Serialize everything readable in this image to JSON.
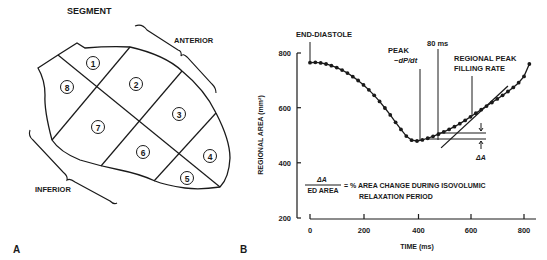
{
  "panel_a": {
    "label": "A",
    "title": "SEGMENT",
    "bracket_labels": {
      "anterior": "ANTERIOR",
      "inferior": "INFERIOR"
    },
    "segments": [
      {
        "number": "1",
        "cx": 93,
        "cy": 63
      },
      {
        "number": "2",
        "cx": 136,
        "cy": 84
      },
      {
        "number": "3",
        "cx": 179,
        "cy": 114
      },
      {
        "number": "4",
        "cx": 210,
        "cy": 156
      },
      {
        "number": "5",
        "cx": 187,
        "cy": 178
      },
      {
        "number": "6",
        "cx": 143,
        "cy": 152
      },
      {
        "number": "7",
        "cx": 98,
        "cy": 127
      },
      {
        "number": "8",
        "cx": 67,
        "cy": 87
      }
    ]
  },
  "panel_b": {
    "label": "B",
    "annotations": {
      "end_diastole": "END-DIASTOLE",
      "peak_line1": "PEAK",
      "peak_line2": "−dP/dt",
      "ms80": "80 ms",
      "regional_peak_line1": "REGIONAL PEAK",
      "regional_peak_line2": "FILLING RATE",
      "delta_a": "ΔA",
      "formula_numerator": "ΔA",
      "formula_denominator": "ED AREA",
      "formula_text_line1": "= % AREA CHANGE DURING ISOVOLUMIC",
      "formula_text_line2": "RELAXATION PERIOD"
    }
  },
  "chart_data": {
    "type": "line",
    "title": "",
    "xlabel": "TIME (ms)",
    "ylabel": "REGIONAL AREA (mm²)",
    "xlim": [
      0,
      850
    ],
    "ylim": [
      200,
      800
    ],
    "x_ticks": [
      0,
      200,
      400,
      600,
      800
    ],
    "y_ticks": [
      200,
      400,
      600,
      800
    ],
    "x_tick_labels": [
      "0",
      "200",
      "400",
      "600",
      "800"
    ],
    "y_tick_labels": [
      "200",
      "400",
      "600",
      "800"
    ],
    "grid": false,
    "legend": null,
    "series": [
      {
        "name": "Regional area",
        "markers": true,
        "x": [
          0,
          20,
          40,
          60,
          80,
          100,
          120,
          140,
          160,
          180,
          200,
          220,
          240,
          260,
          280,
          300,
          320,
          340,
          360,
          380,
          400,
          420,
          440,
          460,
          480,
          500,
          520,
          540,
          560,
          580,
          600,
          620,
          640,
          660,
          680,
          700,
          720,
          740,
          760,
          780,
          800,
          820
        ],
        "values": [
          765,
          766,
          764,
          760,
          754,
          747,
          738,
          727,
          714,
          700,
          684,
          666,
          646,
          624,
          600,
          575,
          548,
          522,
          498,
          483,
          480,
          484,
          490,
          497,
          505,
          513,
          522,
          532,
          543,
          555,
          568,
          581,
          594,
          607,
          620,
          633,
          646,
          660,
          675,
          692,
          715,
          760
        ]
      },
      {
        "name": "Peak filling rate tangent",
        "markers": false,
        "x": [
          490,
          740
        ],
        "values": [
          455,
          680
        ]
      }
    ],
    "vertical_markers": [
      {
        "label": "END-DIASTOLE",
        "x": 0
      },
      {
        "label": "PEAK −dP/dt",
        "x": 395
      },
      {
        "label": "80 ms",
        "x": 475
      },
      {
        "label": "REGIONAL PEAK FILLING RATE",
        "x": 610
      }
    ],
    "horizontal_markers": [
      {
        "label": "ΔA upper",
        "y": 508,
        "x_range": [
          475,
          650
        ]
      },
      {
        "label": "ΔA lower",
        "y": 488,
        "x_range": [
          430,
          650
        ]
      }
    ],
    "annotations": [
      "ΔA / ED AREA = % AREA CHANGE DURING ISOVOLUMIC RELAXATION PERIOD"
    ]
  }
}
